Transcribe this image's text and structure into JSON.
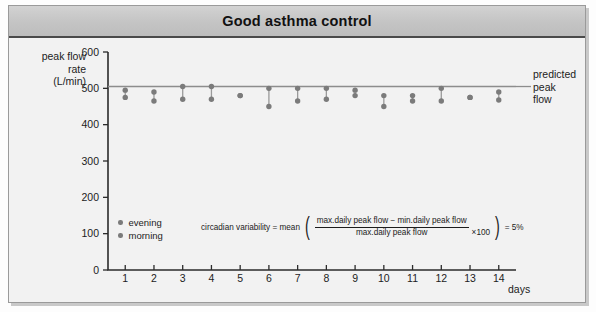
{
  "figure": {
    "title": "Good asthma control"
  },
  "axes": {
    "y_label_line1": "peak flow",
    "y_label_line2": "rate",
    "y_label_line3": "(L/min)",
    "x_label": "days",
    "y_ticks": [
      "0",
      "100",
      "200",
      "300",
      "400",
      "500",
      "600"
    ],
    "x_ticks": [
      "1",
      "2",
      "3",
      "4",
      "5",
      "6",
      "7",
      "8",
      "9",
      "10",
      "11",
      "12",
      "13",
      "14"
    ]
  },
  "annotations": {
    "predicted_line_label": "predicted peak flow",
    "predicted_label_line1": "predicted",
    "predicted_label_line2": "peak",
    "predicted_label_line3": "flow"
  },
  "legend": {
    "items": [
      {
        "label": "evening",
        "color": "#7b7b7b"
      },
      {
        "label": "morning",
        "color": "#7b7b7b"
      }
    ]
  },
  "formula": {
    "lead": "circadian variability = mean",
    "numerator": "max.daily peak flow − min.daily peak flow",
    "denominator": "max.daily peak flow",
    "multiplier": "×100",
    "result": "= 5%"
  },
  "colors": {
    "title_bar": "#c4c4c4",
    "body": "#f2f2f2",
    "marker": "#7b7b7b",
    "predicted_line": "#8d8d8d",
    "axis": "#2b2b2b"
  },
  "chart_data": {
    "type": "scatter",
    "title": "Good asthma control",
    "xlabel": "days",
    "ylabel": "peak flow rate (L/min)",
    "xlim": [
      0.4,
      14.6
    ],
    "ylim": [
      0,
      600
    ],
    "ytick_step": 100,
    "grid": false,
    "legend_position": "inside-lower-left",
    "reference_lines": [
      {
        "name": "predicted peak flow",
        "y": 505,
        "orientation": "horizontal",
        "color": "#8d8d8d"
      }
    ],
    "x": [
      1,
      2,
      3,
      4,
      5,
      6,
      7,
      8,
      9,
      10,
      11,
      12,
      13,
      14
    ],
    "series": [
      {
        "name": "evening",
        "values": [
          495,
          490,
          505,
          505,
          480,
          500,
          500,
          500,
          495,
          480,
          480,
          500,
          475,
          490
        ]
      },
      {
        "name": "morning",
        "values": [
          475,
          465,
          470,
          470,
          480,
          450,
          465,
          470,
          480,
          450,
          465,
          465,
          475,
          468
        ]
      }
    ],
    "annotation": "circadian variability = mean((max.daily peak flow − min.daily peak flow) / max.daily peak flow ×100) = 5%"
  }
}
